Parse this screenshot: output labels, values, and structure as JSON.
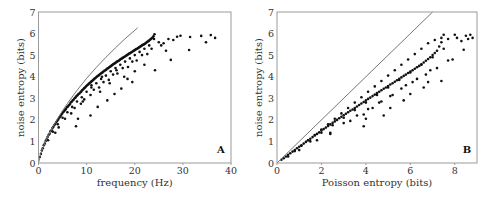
{
  "chart_data": [
    {
      "type": "scatter",
      "panel_label": "A",
      "xlabel": "frequency (Hz)",
      "ylabel": "noise entropy (bits)",
      "xlim": [
        0,
        40
      ],
      "ylim": [
        0,
        7
      ],
      "xticks": [
        "0",
        "10",
        "20",
        "30",
        "40"
      ],
      "yticks": [
        "0",
        "1",
        "2",
        "3",
        "4",
        "5",
        "6",
        "7"
      ],
      "grid": false,
      "reference_curve": {
        "description": "Poisson entropy bound",
        "x": [
          0,
          0.5,
          1,
          2,
          3,
          4,
          5,
          6,
          8,
          10,
          12,
          14,
          16,
          18,
          20,
          20.6
        ],
        "y": [
          0,
          0.45,
          0.75,
          1.25,
          1.68,
          2.07,
          2.43,
          2.76,
          3.37,
          3.92,
          4.43,
          4.9,
          5.34,
          5.76,
          6.15,
          6.27
        ]
      },
      "points": {
        "x": [
          0.3,
          0.5,
          0.7,
          0.9,
          1.1,
          1.3,
          1.5,
          1.7,
          1.9,
          2.1,
          2.3,
          2.5,
          2.7,
          2.9,
          3.1,
          3.3,
          3.5,
          3.7,
          3.9,
          4.1,
          4.3,
          4.5,
          4.7,
          4.9,
          5.1,
          5.3,
          5.5,
          5.7,
          5.9,
          6.1,
          6.3,
          6.5,
          6.7,
          6.9,
          7.1,
          7.3,
          7.5,
          7.7,
          7.9,
          8.1,
          8.3,
          8.5,
          8.7,
          8.9,
          9.1,
          9.3,
          9.5,
          9.7,
          9.9,
          10.1,
          10.3,
          10.5,
          10.7,
          10.9,
          11.1,
          11.3,
          11.5,
          11.7,
          11.9,
          12.1,
          12.3,
          12.5,
          12.7,
          12.9,
          13.1,
          13.3,
          13.5,
          13.7,
          13.9,
          14.1,
          14.3,
          14.5,
          14.7,
          14.9,
          15.1,
          15.3,
          15.5,
          15.7,
          15.9,
          16.1,
          16.3,
          16.5,
          16.7,
          16.9,
          17.1,
          17.3,
          17.5,
          17.7,
          17.9,
          18.1,
          18.3,
          18.5,
          18.7,
          18.9,
          19.1,
          19.3,
          19.5,
          19.7,
          19.9,
          20.1,
          20.3,
          20.5,
          20.7,
          20.9,
          21.1,
          21.3,
          21.5,
          21.7,
          21.9,
          22.1,
          22.3,
          22.5,
          22.7,
          22.9,
          23.1,
          23.3,
          23.5,
          23.7,
          23.9,
          24.1,
          2.0,
          3.0,
          4.0,
          5.0,
          6.0,
          7.0,
          8.0,
          9.0,
          10.0,
          11.0,
          12.0,
          13.0,
          14.0,
          15.0,
          16.0,
          17.0,
          18.0,
          19.0,
          20.0,
          21.0,
          22.0,
          23.0,
          24.0,
          3.5,
          5.5,
          7.5,
          9.5,
          11.5,
          13.5,
          15.5,
          17.5,
          19.5,
          21.5,
          23.5,
          4.2,
          6.8,
          8.8,
          10.8,
          12.6,
          14.6,
          16.4,
          18.6,
          20.4,
          22.6,
          25.0,
          26.0,
          27.0,
          28.0,
          28.8,
          29.5,
          7.8,
          10.8,
          12.3,
          14.3,
          15.8,
          17.2,
          18.5,
          19.5,
          22.0,
          24.2,
          27.5,
          31.3,
          31.5,
          33.8,
          34.8,
          35.8,
          36.7,
          8.2,
          9.2,
          11.0,
          12.8,
          13.2,
          14.8,
          16.2,
          17.8,
          20.0,
          25.5,
          26.5
        ],
        "y": [
          0.28,
          0.42,
          0.58,
          0.68,
          0.82,
          0.9,
          1.02,
          1.1,
          1.2,
          1.3,
          1.36,
          1.47,
          1.52,
          1.62,
          1.68,
          1.76,
          1.82,
          1.9,
          1.96,
          2.02,
          2.1,
          2.15,
          2.22,
          2.28,
          2.35,
          2.4,
          2.46,
          2.5,
          2.58,
          2.62,
          2.68,
          2.72,
          2.8,
          2.84,
          2.9,
          2.93,
          3.0,
          3.04,
          3.1,
          3.14,
          3.2,
          3.22,
          3.28,
          3.32,
          3.38,
          3.42,
          3.47,
          3.5,
          3.56,
          3.6,
          3.64,
          3.68,
          3.72,
          3.76,
          3.8,
          3.84,
          3.88,
          3.92,
          3.95,
          4.0,
          4.03,
          4.06,
          4.1,
          4.14,
          4.17,
          4.2,
          4.24,
          4.28,
          4.3,
          4.34,
          4.38,
          4.4,
          4.44,
          4.47,
          4.5,
          4.54,
          4.57,
          4.6,
          4.63,
          4.66,
          4.7,
          4.72,
          4.75,
          4.78,
          4.82,
          4.84,
          4.87,
          4.9,
          4.93,
          4.96,
          4.99,
          5.02,
          5.05,
          5.08,
          5.1,
          5.13,
          5.16,
          5.19,
          5.22,
          5.25,
          5.28,
          5.3,
          5.33,
          5.36,
          5.39,
          5.42,
          5.45,
          5.48,
          5.5,
          5.53,
          5.56,
          5.6,
          5.63,
          5.66,
          5.7,
          5.74,
          5.78,
          5.82,
          5.88,
          5.97,
          1.05,
          1.45,
          1.8,
          2.1,
          2.35,
          2.6,
          2.85,
          3.05,
          3.3,
          3.5,
          3.7,
          3.9,
          4.05,
          4.25,
          4.4,
          4.55,
          4.7,
          4.85,
          5.0,
          5.15,
          5.3,
          5.45,
          5.75,
          1.4,
          2.05,
          2.55,
          2.95,
          3.4,
          3.75,
          4.1,
          4.4,
          4.7,
          5.0,
          5.3,
          1.65,
          2.3,
          2.75,
          3.15,
          3.5,
          3.85,
          4.15,
          4.45,
          4.75,
          5.05,
          5.6,
          5.55,
          5.75,
          5.7,
          5.85,
          5.9,
          1.7,
          2.2,
          2.6,
          2.9,
          3.2,
          3.45,
          3.9,
          3.75,
          4.55,
          4.3,
          4.78,
          5.24,
          5.84,
          5.89,
          5.6,
          5.93,
          5.8,
          2.05,
          2.85,
          3.6,
          3.3,
          4.0,
          3.7,
          4.3,
          4.0,
          4.25,
          5.45,
          5.2
        ]
      }
    },
    {
      "type": "scatter",
      "panel_label": "B",
      "xlabel": "Poisson entropy (bits)",
      "ylabel": "noise entropy (bits)",
      "xlim": [
        0,
        9
      ],
      "ylim": [
        0,
        7
      ],
      "xticks": [
        "0",
        "2",
        "4",
        "6",
        "8"
      ],
      "yticks": [
        "0",
        "1",
        "2",
        "3",
        "4",
        "5",
        "6",
        "7"
      ],
      "grid": false,
      "reference_curve": {
        "description": "identity line y = x",
        "x": [
          0,
          7
        ],
        "y": [
          0,
          7
        ]
      },
      "points": {
        "x": [
          0.2,
          0.3,
          0.4,
          0.5,
          0.6,
          0.7,
          0.8,
          0.9,
          1.0,
          1.1,
          1.2,
          1.3,
          1.4,
          1.5,
          1.6,
          1.7,
          1.8,
          1.9,
          2.0,
          2.1,
          2.2,
          2.3,
          2.4,
          2.5,
          2.6,
          2.7,
          2.8,
          2.9,
          3.0,
          3.1,
          3.2,
          3.3,
          3.4,
          3.5,
          3.6,
          3.7,
          3.8,
          3.9,
          4.0,
          4.1,
          4.2,
          4.3,
          4.4,
          4.5,
          4.6,
          4.7,
          4.8,
          4.9,
          5.0,
          5.1,
          5.2,
          5.3,
          5.4,
          5.5,
          5.6,
          5.7,
          5.8,
          5.9,
          6.0,
          6.1,
          6.2,
          6.3,
          6.4,
          6.5,
          6.6,
          6.7,
          6.8,
          6.9,
          7.0,
          7.1,
          7.2,
          7.3,
          7.4,
          7.5,
          0.5,
          0.8,
          1.1,
          1.4,
          1.7,
          2.0,
          2.3,
          2.6,
          2.9,
          3.2,
          3.5,
          3.8,
          4.1,
          4.4,
          4.7,
          5.0,
          5.3,
          5.6,
          5.9,
          6.2,
          6.5,
          6.8,
          7.1,
          7.4,
          7.7,
          8.0,
          1.0,
          1.5,
          2.0,
          2.5,
          3.0,
          3.5,
          4.0,
          4.5,
          5.0,
          5.5,
          6.0,
          6.5,
          7.0,
          7.5,
          1.8,
          2.4,
          3.3,
          3.9,
          4.3,
          4.7,
          5.1,
          5.6,
          6.1,
          6.7,
          7.2,
          7.7,
          3.0,
          3.6,
          4.1,
          4.6,
          5.2,
          5.8,
          6.3,
          6.9,
          2.4,
          3.9,
          4.0,
          4.8,
          5.1,
          5.7,
          6.0,
          6.6,
          6.8,
          7.4,
          7.9,
          8.4,
          8.1,
          8.3,
          8.6,
          8.7,
          8.8,
          8.5
        ],
        "y": [
          0.15,
          0.22,
          0.3,
          0.38,
          0.45,
          0.53,
          0.6,
          0.68,
          0.75,
          0.82,
          0.9,
          0.98,
          1.05,
          1.12,
          1.2,
          1.28,
          1.35,
          1.42,
          1.5,
          1.57,
          1.64,
          1.72,
          1.79,
          1.86,
          1.93,
          2.0,
          2.07,
          2.14,
          2.21,
          2.28,
          2.35,
          2.42,
          2.48,
          2.55,
          2.62,
          2.69,
          2.76,
          2.83,
          2.9,
          2.97,
          3.03,
          3.1,
          3.17,
          3.24,
          3.3,
          3.37,
          3.44,
          3.5,
          3.57,
          3.64,
          3.7,
          3.77,
          3.84,
          3.9,
          3.97,
          4.04,
          4.1,
          4.17,
          4.24,
          4.3,
          4.37,
          4.44,
          4.5,
          4.58,
          4.66,
          4.74,
          4.82,
          4.9,
          5.0,
          5.1,
          5.2,
          5.4,
          5.6,
          5.95,
          0.3,
          0.55,
          0.8,
          1.05,
          1.3,
          1.55,
          1.8,
          2.05,
          2.3,
          2.55,
          2.8,
          3.05,
          3.3,
          3.55,
          3.8,
          4.05,
          4.3,
          4.55,
          4.8,
          5.05,
          5.3,
          5.55,
          5.7,
          5.8,
          5.75,
          5.95,
          0.6,
          1.0,
          1.4,
          1.75,
          2.1,
          2.45,
          2.8,
          3.15,
          3.5,
          3.85,
          4.2,
          4.55,
          4.9,
          5.3,
          1.05,
          1.4,
          1.95,
          2.25,
          2.55,
          2.85,
          3.1,
          3.45,
          3.75,
          4.1,
          4.4,
          4.75,
          1.85,
          2.2,
          2.5,
          2.8,
          3.15,
          3.6,
          3.9,
          4.3,
          1.35,
          1.7,
          2.05,
          2.2,
          2.55,
          2.9,
          3.2,
          3.5,
          3.75,
          3.8,
          4.8,
          5.25,
          5.8,
          5.65,
          5.75,
          5.95,
          5.8,
          5.9
        ]
      }
    }
  ]
}
